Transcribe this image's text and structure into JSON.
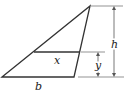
{
  "diagram": {
    "type": "triangle-cross-section",
    "labels": {
      "cross_section": "x",
      "base": "b",
      "height": "h",
      "section_height": "y"
    },
    "colors": {
      "stroke": "#333333",
      "dimension": "#555555"
    }
  }
}
